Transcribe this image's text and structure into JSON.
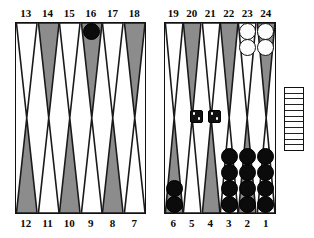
{
  "board": {
    "title": "Backgammon board position diagram",
    "checker_colors": {
      "black": "#0b0b0b",
      "white": "#fdfdfd"
    },
    "point_colors": {
      "shaded": "#8c8c8c",
      "plain": "#ffffff",
      "outline": "#1a1a1a"
    },
    "labels": {
      "top_left": [
        "13",
        "14",
        "15",
        "16",
        "17",
        "18"
      ],
      "top_right": [
        "19",
        "20",
        "21",
        "22",
        "23",
        "24"
      ],
      "bottom_left": [
        "12",
        "11",
        "10",
        "9",
        "8",
        "7"
      ],
      "bottom_right": [
        "6",
        "5",
        "4",
        "3",
        "2",
        "1"
      ]
    },
    "quadrants": {
      "top_left": [
        {
          "point": "13",
          "shaded": false,
          "checkers": 0,
          "color": null
        },
        {
          "point": "14",
          "shaded": true,
          "checkers": 0,
          "color": null
        },
        {
          "point": "15",
          "shaded": false,
          "checkers": 0,
          "color": null
        },
        {
          "point": "16",
          "shaded": true,
          "checkers": 1,
          "color": "black"
        },
        {
          "point": "17",
          "shaded": false,
          "checkers": 0,
          "color": null
        },
        {
          "point": "18",
          "shaded": true,
          "checkers": 0,
          "color": null
        }
      ],
      "top_right": [
        {
          "point": "19",
          "shaded": false,
          "checkers": 0,
          "color": null
        },
        {
          "point": "20",
          "shaded": true,
          "checkers": 0,
          "color": null
        },
        {
          "point": "21",
          "shaded": false,
          "checkers": 0,
          "color": null
        },
        {
          "point": "22",
          "shaded": true,
          "checkers": 0,
          "color": null
        },
        {
          "point": "23",
          "shaded": false,
          "checkers": 2,
          "color": "white"
        },
        {
          "point": "24",
          "shaded": true,
          "checkers": 2,
          "color": "white"
        }
      ],
      "bottom_left": [
        {
          "point": "12",
          "shaded": true,
          "checkers": 0,
          "color": null
        },
        {
          "point": "11",
          "shaded": false,
          "checkers": 0,
          "color": null
        },
        {
          "point": "10",
          "shaded": true,
          "checkers": 0,
          "color": null
        },
        {
          "point": "9",
          "shaded": false,
          "checkers": 0,
          "color": null
        },
        {
          "point": "8",
          "shaded": true,
          "checkers": 0,
          "color": null
        },
        {
          "point": "7",
          "shaded": false,
          "checkers": 0,
          "color": null
        }
      ],
      "bottom_right": [
        {
          "point": "6",
          "shaded": true,
          "checkers": 2,
          "color": "black"
        },
        {
          "point": "5",
          "shaded": false,
          "checkers": 0,
          "color": null
        },
        {
          "point": "4",
          "shaded": true,
          "checkers": 0,
          "color": null
        },
        {
          "point": "3",
          "shaded": false,
          "checkers": 4,
          "color": "black"
        },
        {
          "point": "2",
          "shaded": true,
          "checkers": 4,
          "color": "black"
        },
        {
          "point": "1",
          "shaded": false,
          "checkers": 4,
          "color": "black"
        }
      ]
    },
    "dice": [
      {
        "name": "die-left",
        "value": 2,
        "body_color": "#101010",
        "pip_color": "#ffffff"
      },
      {
        "name": "die-right",
        "value": 2,
        "body_color": "#101010",
        "pip_color": "#ffffff"
      }
    ],
    "bearoff_tray": {
      "label": "bear-off tray",
      "slots": 11,
      "checkers_borne_off": 0
    }
  }
}
